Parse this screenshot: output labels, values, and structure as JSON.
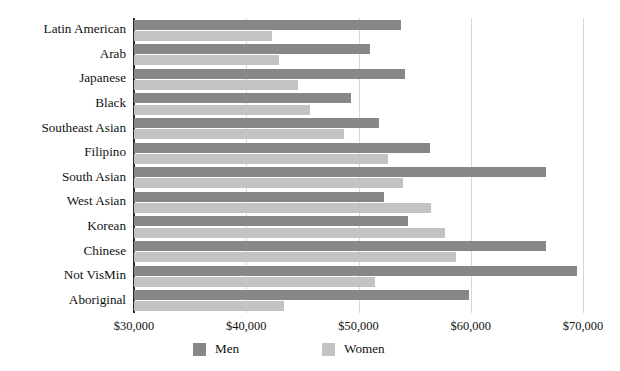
{
  "chart_data": {
    "type": "bar",
    "orientation": "horizontal",
    "title": "",
    "xlabel": "",
    "ylabel": "",
    "xlim": [
      30000,
      70000
    ],
    "xticks": [
      30000,
      40000,
      50000,
      60000,
      70000
    ],
    "xtick_labels": [
      "$30,000",
      "$40,000",
      "$50,000",
      "$60,000",
      "$70,000"
    ],
    "grid": "vertical",
    "legend_position": "bottom",
    "categories": [
      "Latin American",
      "Arab",
      "Japanese",
      "Black",
      "Southeast Asian",
      "Filipino",
      "South Asian",
      "West Asian",
      "Korean",
      "Chinese",
      "Not VisMin",
      "Aboriginal"
    ],
    "series": [
      {
        "name": "Men",
        "color": "#878787",
        "values": [
          53800,
          51000,
          54100,
          49300,
          51800,
          56400,
          66700,
          52300,
          54400,
          66700,
          69500,
          59800
        ]
      },
      {
        "name": "Women",
        "color": "#c3c3c3",
        "values": [
          42300,
          42900,
          44600,
          45700,
          48700,
          52600,
          54000,
          56500,
          57700,
          58700,
          51500,
          43400
        ]
      }
    ]
  },
  "legend": {
    "entries": [
      {
        "label": "Men",
        "color": "#878787"
      },
      {
        "label": "Women",
        "color": "#c3c3c3"
      }
    ]
  }
}
